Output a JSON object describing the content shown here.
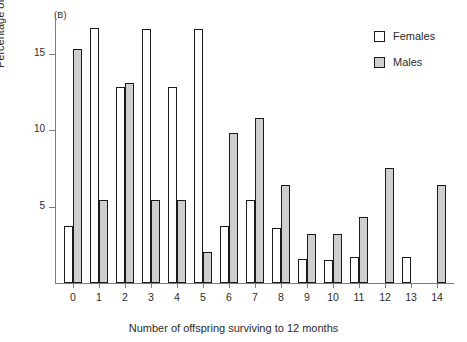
{
  "panel": {
    "label": "(B)"
  },
  "legend": {
    "position": "top-right",
    "entries": [
      {
        "label": "Females",
        "swatch": "legend-swatch-female",
        "color": "#ffffff"
      },
      {
        "label": "Males",
        "swatch": "legend-swatch-male",
        "color": "#cfcfcf"
      }
    ]
  },
  "chart_data": {
    "type": "bar",
    "title": "(B)",
    "xlabel": "Number of offspring surviving to 12 months",
    "ylabel": "Percentage of breeders",
    "categories": [
      "0",
      "1",
      "2",
      "3",
      "4",
      "5",
      "6",
      "7",
      "8",
      "9",
      "10",
      "11",
      "12",
      "13",
      "14"
    ],
    "series": [
      {
        "name": "Females",
        "color": "#ffffff",
        "values": [
          3.7,
          16.7,
          12.8,
          16.6,
          12.8,
          16.6,
          3.7,
          5.4,
          3.6,
          1.6,
          1.5,
          1.7,
          0,
          1.7,
          0
        ]
      },
      {
        "name": "Males",
        "color": "#cfcfcf",
        "values": [
          15.3,
          5.4,
          13.1,
          5.4,
          5.4,
          2.0,
          9.8,
          10.8,
          6.4,
          3.2,
          3.2,
          4.3,
          7.5,
          0,
          6.4
        ]
      }
    ],
    "ylim": [
      0,
      17.6
    ],
    "yticks": [
      5,
      10,
      15
    ],
    "ytick_labels": [
      "5",
      "10",
      "15"
    ],
    "xlim": [
      -0.6,
      14.6
    ],
    "grid": false,
    "legend_position": "top-right"
  }
}
